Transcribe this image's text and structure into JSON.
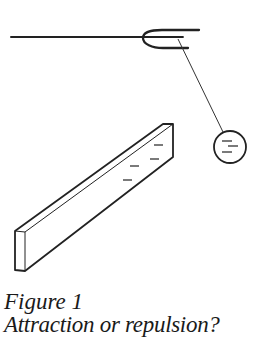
{
  "figure": {
    "caption_title": "Figure 1",
    "caption_subtitle": "Attraction or repulsion?",
    "line_color": "#222222",
    "elements": [
      "support-stand",
      "fork-holder",
      "suspension-thread",
      "charged-ball",
      "charged-rod"
    ]
  }
}
